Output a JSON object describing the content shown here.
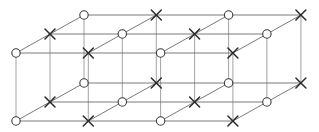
{
  "diagram": {
    "title": "",
    "colors": {
      "background": "#ffffff",
      "edge": "#6b6b6b",
      "vertical_edge": "#8a8a8a",
      "circle_stroke": "#3a3a3a",
      "cross_stroke": "#2a2a2a"
    },
    "geometry": {
      "origin_x": 16,
      "front_top_y": 53,
      "column_step_x": 72.3,
      "depth_step_x": 34,
      "depth_step_y": -19,
      "layer_height": 68,
      "columns": 4,
      "rows_deep": 3,
      "layers": 2,
      "circle_radius": 4.2,
      "cross_half": 5
    },
    "layers": [
      {
        "name": "top",
        "rows": [
          {
            "name": "front",
            "nodes": [
              "circle",
              "cross",
              "circle",
              "cross"
            ]
          },
          {
            "name": "middle",
            "nodes": [
              "cross",
              "circle",
              "cross",
              "circle"
            ]
          },
          {
            "name": "back",
            "nodes": [
              "circle",
              "cross",
              "circle",
              "cross"
            ]
          }
        ]
      },
      {
        "name": "bottom",
        "rows": [
          {
            "name": "front",
            "nodes": [
              "circle",
              "cross",
              "circle",
              "cross"
            ]
          },
          {
            "name": "middle",
            "nodes": [
              "cross",
              "circle",
              "cross",
              "circle"
            ]
          },
          {
            "name": "back",
            "nodes": [
              "circle",
              "cross",
              "circle",
              "cross"
            ]
          }
        ]
      }
    ],
    "legend": {
      "circle": "circle-site",
      "cross": "cross-site"
    }
  }
}
